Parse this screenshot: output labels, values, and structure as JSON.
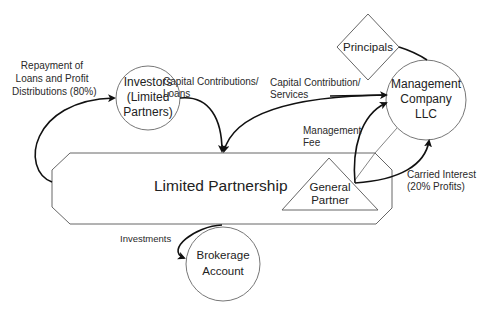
{
  "diagram": {
    "nodes": {
      "investors": {
        "label": "Investors\n(Limited\nPartners)",
        "shape": "circle"
      },
      "management_company": {
        "label": "Management\nCompany\nLLC",
        "shape": "circle"
      },
      "principals": {
        "label": "Principals",
        "shape": "diamond"
      },
      "limited_partnership": {
        "label": "Limited Partnership",
        "shape": "octagon-banner"
      },
      "general_partner": {
        "label": "General\nPartner",
        "shape": "triangle"
      },
      "brokerage_account": {
        "label": "Brokerage\nAccount",
        "shape": "circle"
      }
    },
    "edges": [
      {
        "from": "limited_partnership",
        "to": "investors",
        "label": "Repayment of\nLoans and Profit\nDistributions (80%)"
      },
      {
        "from": "investors",
        "to": "limited_partnership",
        "label": "Capital Contributions/\nLoans"
      },
      {
        "from": "management_company",
        "to": "limited_partnership",
        "label": "Capital Contribution/\nServices"
      },
      {
        "from": "general_partner",
        "to": "management_company",
        "label": "Management\nFee"
      },
      {
        "from": "general_partner",
        "to": "management_company",
        "label": "Carried Interest\n(20% Profits)"
      },
      {
        "from": "limited_partnership",
        "to": "brokerage_account",
        "label": "Investments"
      },
      {
        "from": "principals",
        "to": "management_company",
        "label": ""
      }
    ],
    "colors": {
      "stroke": "#555555",
      "arrow": "#111111",
      "text": "#222222"
    }
  }
}
